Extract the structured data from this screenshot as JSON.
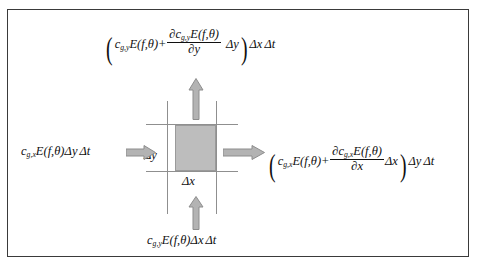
{
  "figure": {
    "frame_color": "#3a3a3a",
    "cell_fill": "#bdbdbd",
    "arrow_fill": "#b0b0b0",
    "arrow_stroke": "#8a8a8a",
    "gridline_color": "#8f8f8f"
  },
  "cell": {
    "width_label_parts": {
      "delta": "Δ",
      "var": "x"
    },
    "height_label_parts": {
      "delta": "Δ",
      "var": "y"
    },
    "width_label": "Δx",
    "height_label": "Δy"
  },
  "flux_in_left": {
    "name": "x-direction energy flux into cell",
    "parts": {
      "c": "c",
      "sub": "g,x",
      "E": "E",
      "args": "(f,θ)",
      "dy": "Δy",
      "dt": "Δt"
    },
    "plain": "c_{g,x} E(f,θ) Δy Δt"
  },
  "flux_in_bottom": {
    "name": "y-direction energy flux into cell",
    "parts": {
      "c": "c",
      "sub": "g,y",
      "E": "E",
      "args": "(f,θ)",
      "dx": "Δx",
      "dt": "Δt"
    },
    "plain": "c_{g,y} E(f,θ) Δx Δt"
  },
  "flux_out_right": {
    "name": "x-direction energy flux out of cell",
    "parts": {
      "open": "(",
      "c": "c",
      "sub": "g,x",
      "E": "E",
      "args": "(f,θ)",
      "plus": "+",
      "num_partial": "∂",
      "num_c": "c",
      "num_sub": "g,x",
      "num_E": "E",
      "num_args": "(f,θ)",
      "den_partial": "∂",
      "den_var": "x",
      "dx": "Δx",
      "close": ")",
      "dy": "Δy",
      "dt": "Δt"
    },
    "plain": "( c_{g,x} E(f,θ) + ∂c_{g,x}E(f,θ)/∂x Δx ) Δy Δt"
  },
  "flux_out_top": {
    "name": "y-direction energy flux out of cell",
    "parts": {
      "open": "(",
      "c": "c",
      "sub": "g,y",
      "E": "E",
      "args": "(f,θ)",
      "plus": "+",
      "num_partial": "∂",
      "num_c": "c",
      "num_sub": "g,y",
      "num_E": "E",
      "num_args": "(f,θ)",
      "den_partial": "∂",
      "den_var": "y",
      "dy": "Δy",
      "close": ")",
      "dx": "Δx",
      "dt": "Δt"
    },
    "plain": "( c_{g,y} E(f,θ) + ∂c_{g,y}E(f,θ)/∂y Δy ) Δx Δt"
  }
}
